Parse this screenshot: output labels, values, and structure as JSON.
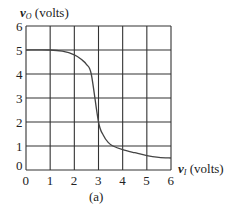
{
  "chart_data": {
    "type": "line",
    "title": "",
    "caption": "(a)",
    "xlabel": "v_I (volts)",
    "ylabel": "v_O (volts)",
    "xlim": [
      0,
      6
    ],
    "ylim": [
      0,
      6
    ],
    "grid": true,
    "x_ticks": [
      "0",
      "1",
      "2",
      "3",
      "4",
      "5",
      "6"
    ],
    "y_ticks": [
      "0",
      "1",
      "2",
      "3",
      "4",
      "5",
      "6"
    ],
    "series": [
      {
        "name": "v_O vs v_I",
        "x": [
          0,
          1,
          1.5,
          2,
          2.3,
          2.5,
          2.7,
          3,
          3.2,
          3.4,
          3.6,
          4,
          4.5,
          5,
          5.5,
          6
        ],
        "y": [
          5,
          5,
          4.95,
          4.8,
          4.6,
          4.4,
          4.0,
          2.0,
          1.45,
          1.15,
          1.0,
          0.85,
          0.72,
          0.6,
          0.53,
          0.5
        ]
      }
    ]
  },
  "labels": {
    "ylabel_var": "v",
    "ylabel_sub": "O",
    "ylabel_unit": " (volts)",
    "xlabel_var": "v",
    "xlabel_sub": "I",
    "xlabel_unit": " (volts)",
    "caption": "(a)"
  }
}
